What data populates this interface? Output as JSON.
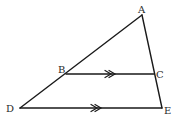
{
  "diagram": {
    "type": "geometry",
    "points": {
      "A": {
        "label": "A",
        "x": 142,
        "y": 15
      },
      "B": {
        "label": "B",
        "x": 66,
        "y": 74
      },
      "C": {
        "label": "C",
        "x": 154,
        "y": 74
      },
      "D": {
        "label": "D",
        "x": 20,
        "y": 108
      },
      "E": {
        "label": "E",
        "x": 162,
        "y": 108
      }
    },
    "segments": [
      {
        "from": "A",
        "to": "D"
      },
      {
        "from": "A",
        "to": "E"
      },
      {
        "from": "B",
        "to": "C",
        "marker": "double-arrow"
      },
      {
        "from": "D",
        "to": "E",
        "marker": "double-arrow"
      }
    ],
    "relations": [
      "BC ∥ DE"
    ],
    "colors": {
      "line": "#1a1a1a",
      "label": "#2a2a2a",
      "background": "#ffffff"
    }
  }
}
